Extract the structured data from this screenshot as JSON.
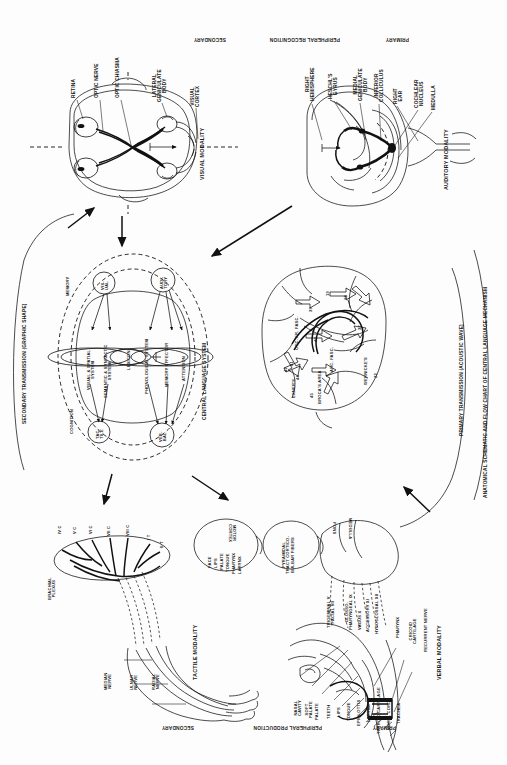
{
  "figure": {
    "title": "ANATOMICAL SCHEMATIC AND FLOW CHART OF CENTRAL LANGUAGE MECHANISM",
    "orientation_note": "rotated-180",
    "background": "#fdfdfd",
    "ink": "#111111"
  },
  "band_labels": {
    "top_left": "SECONDARY",
    "top_center": "PERIPHERAL RECOGNITION",
    "top_right": "PRIMARY",
    "bottom_left": "SECONDARY",
    "bottom_center": "PERIPHERAL PRODUCTION",
    "bottom_right": "PRIMARY"
  },
  "modalities": {
    "visual": "VISUAL MODALITY",
    "auditory": "AUDITORY MODALITY",
    "tactile": "TACTILE MODALITY",
    "verbal": "VERBAL MODALITY"
  },
  "transmission": {
    "secondary": "SECONDARY TRANSMISSION (GRAPHIC SHAPE)",
    "primary": "PRIMARY TRANSMISSION (ACOUSTIC WAVE)"
  },
  "visual_pathway": {
    "labels": [
      "RETINA",
      "OPTIC NERVE",
      "OPTIC CHIASMA",
      "LATERAL\nGENICULATE\nBODY",
      "VISUAL\nCORTEX"
    ]
  },
  "auditory_pathway": {
    "labels": [
      "RIGHT\nHEMISPHERE",
      "HESCHL'S\nGYRUS",
      "MEDIAL\nGENICULATE\nBODY",
      "INFERIOR\nCOLLICULUS",
      "RIGHT\nEAR",
      "COCHLEAR\nNUCLEUS",
      "MEDULLA"
    ]
  },
  "central_language_system": {
    "outer_label": "CENTRAL LANGUAGE SYSTEM",
    "ring_labels": [
      "MEMORY",
      "COGNITION"
    ],
    "input_nodes": [
      {
        "id": "visual",
        "label": "VIS-\nUAL"
      },
      {
        "id": "auditory",
        "label": "AUDI-\nTORY"
      }
    ],
    "output_nodes": [
      {
        "id": "tactile",
        "label": "TAC-\nTILE"
      },
      {
        "id": "verbal",
        "label": "VER-\nBAL"
      }
    ],
    "modules": [
      {
        "id": "visual-spatial",
        "label": "VISUAL & SPATIAL\nSYSTEM"
      },
      {
        "id": "semantic-syntactic",
        "label": "SEMANTIC & SYNTACTIC\nSYSTEM"
      },
      {
        "id": "lexicon",
        "label": "LEXICON"
      },
      {
        "id": "phonological",
        "label": "PHONOLOGICAL SYSTEM"
      },
      {
        "id": "memory-effector",
        "label": "MEMORY EFFECTOR"
      },
      {
        "id": "attention",
        "label": "ATTENTION"
      }
    ]
  },
  "brain_flowchart": {
    "area_numbers": [
      "18",
      "19",
      "37",
      "39",
      "40",
      "22",
      "44",
      "45",
      "41",
      "42"
    ],
    "named_tracts": [
      "OCC. FR. FASC.",
      "ARC. FASC.",
      "BROCA'S AREA",
      "WERNICKE'S",
      "EXNER'S"
    ]
  },
  "tactile_pathway": {
    "plexus_label": "BRACHIAL\nPLEXUS",
    "roots": [
      "IV C",
      "V C",
      "VI C",
      "VII C",
      "VIII C",
      "I T",
      "II T"
    ],
    "nerves": [
      "MEDIAN\nNERVE",
      "ULNAR\nNERVE",
      "RADIAL\nNERVE"
    ]
  },
  "verbal_pathway": {
    "motor_cortex": {
      "title": "MOTOR\nCORTEX",
      "somatotopy": [
        "FACE",
        "LIPS",
        "PALATE",
        "TONGUE",
        "PHARYNX",
        "LARYNX"
      ]
    },
    "tract": "PYRAMIDAL\nTRACT CORTICO-\nBULBAR FIBERS",
    "brainstem": [
      "PONS",
      "MEDULLA"
    ],
    "cranial_nerves": [
      "TRIGEMINAL V\nFACIAL VII",
      "GLOSSO-\nPHARYNGEAL IX",
      "VAGUS X",
      "ACCESSORY XI",
      "HYPOGLOSSAL XII"
    ],
    "vocal_tract": [
      "NASAL\nCAVITY",
      "SOFT\nPALATE",
      "PALATE",
      "TEETH",
      "LIPS",
      "TONGUE",
      "EPIGLOTTIS",
      "LARYNX",
      "THYROID CARTILAGE",
      "VOCAL CORDS",
      "TRACHEA"
    ],
    "right_labels": [
      "PHARYNX",
      "CRICOID\nCARTILAGE",
      "RECURRENT NERVE"
    ]
  }
}
